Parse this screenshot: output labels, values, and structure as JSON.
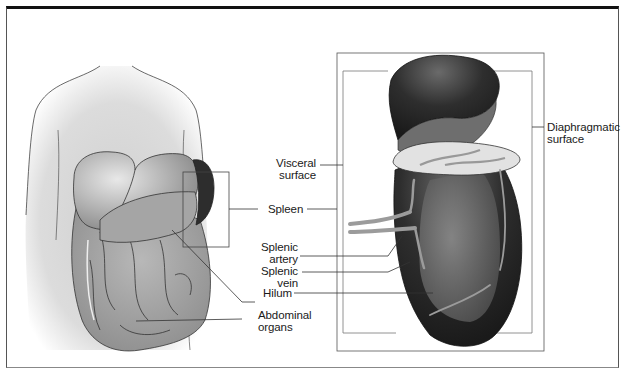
{
  "figure": {
    "left_panel": {
      "title": "Torso with abdominal organs"
    },
    "right_panel": {
      "title": "Spleen detail"
    },
    "labels": {
      "visceral_surface": [
        "Visceral",
        "surface"
      ],
      "spleen": "Spleen",
      "splenic_artery": [
        "Splenic",
        "artery"
      ],
      "splenic_vein": [
        "Splenic",
        "vein"
      ],
      "hilum": "Hilum",
      "abdominal_organs": [
        "Abdominal",
        "organs"
      ],
      "diaphragmatic_surface": [
        "Diaphragmatic",
        "surface"
      ]
    },
    "colors": {
      "frame": "#111111",
      "body_fill": "#d9d9d9",
      "organ_fill": "#9a9a9a",
      "spleen_dark": "#2a2a2a",
      "vessel": "#8f8f8f",
      "leader_line": "#333333"
    }
  }
}
